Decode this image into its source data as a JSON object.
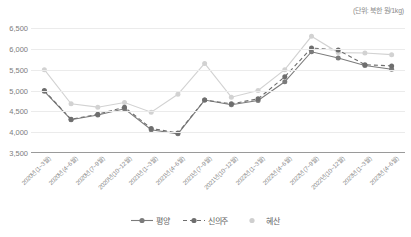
{
  "unit_note": "(단위: 북한 원/1kg)",
  "legend": {
    "items": [
      {
        "label": "평양",
        "color": "#7b7b7b",
        "style": "solid",
        "marker": "circle"
      },
      {
        "label": "신의주",
        "color": "#6e6e6e",
        "style": "dashed",
        "marker": "circle"
      },
      {
        "label": "혜산",
        "color": "#cfcfcf",
        "style": "none",
        "marker": "circle"
      }
    ]
  },
  "chart_data": {
    "type": "line",
    "title": "",
    "xlabel": "",
    "ylabel": "",
    "unit": "북한 원/1kg",
    "ylim": [
      3500,
      6500
    ],
    "yticks": [
      3500,
      4000,
      4500,
      5000,
      5500,
      6000,
      6500
    ],
    "ytick_labels": [
      "3,500",
      "4,000",
      "4,500",
      "5,000",
      "5,500",
      "6,000",
      "6,500"
    ],
    "grid": true,
    "legend_position": "bottom",
    "categories": [
      "2020년(1~3월)",
      "2020년(4~6월)",
      "2020년(7~9월)",
      "2020년(10~12월)",
      "2021년(1~3월)",
      "2021년(4~6월)",
      "2021년(7~9월)",
      "2021년(10~12월)",
      "2022년(1~3월)",
      "2022년(4~6월)",
      "2022년(7~9월)",
      "2022년(10~12월)",
      "2023년(1~3월)",
      "2023년(4~6월)"
    ],
    "series": [
      {
        "name": "평양",
        "color": "#7b7b7b",
        "dash": "none",
        "values": [
          4980,
          4300,
          4410,
          4560,
          4060,
          3960,
          4770,
          4660,
          4760,
          5210,
          5930,
          5780,
          5600,
          5510
        ]
      },
      {
        "name": "신의주",
        "color": "#6e6e6e",
        "dash": "4 3",
        "values": [
          5000,
          4310,
          4430,
          4600,
          4090,
          3980,
          4770,
          4680,
          4800,
          5330,
          6020,
          5970,
          5620,
          5590
        ]
      },
      {
        "name": "혜산",
        "color": "#d2d2d2",
        "dash": "none",
        "values": [
          5500,
          4680,
          4600,
          4710,
          4480,
          4910,
          5650,
          4840,
          5000,
          5500,
          6300,
          5910,
          5900,
          5860
        ]
      }
    ]
  }
}
